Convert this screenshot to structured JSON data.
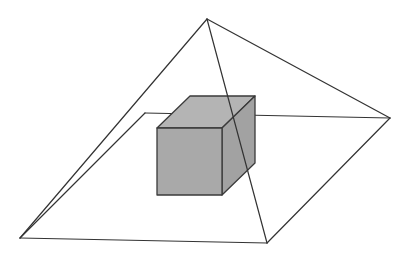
{
  "diagram": {
    "colors": {
      "background": "#ffffff",
      "edge": "#333333",
      "cube_front": "#a9a9a9",
      "cube_top": "#b4b4b4",
      "cube_side": "#a2a2a2",
      "cube_edge": "#3a3a3a"
    },
    "pyramid": {
      "apex": [
        207,
        19
      ],
      "base": {
        "left": [
          20,
          238
        ],
        "front": [
          267,
          243
        ],
        "right": [
          390,
          118
        ],
        "back": [
          145,
          113
        ]
      }
    },
    "cube": {
      "front_top_left": [
        157,
        128
      ],
      "front_top_right": [
        222,
        128
      ],
      "front_bottom_left": [
        157,
        195
      ],
      "front_bottom_right": [
        222,
        195
      ],
      "back_top_left": [
        190,
        96
      ],
      "back_top_right": [
        255,
        96
      ],
      "back_bottom_right": [
        255,
        163
      ]
    }
  }
}
